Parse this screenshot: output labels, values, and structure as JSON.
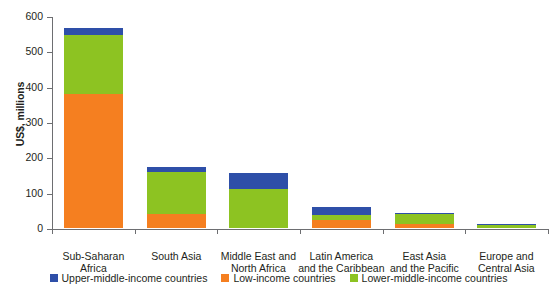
{
  "chart_data": {
    "type": "bar",
    "subtype": "stacked-vertical",
    "title": "",
    "xlabel": "",
    "ylabel": "US$, millions",
    "ylim": [
      0,
      600
    ],
    "yticks": [
      0,
      100,
      200,
      300,
      400,
      500,
      600
    ],
    "ytick_labels": [
      "0",
      "100",
      "200",
      "300",
      "400",
      "500",
      "600"
    ],
    "grid": false,
    "legend_position": "bottom-center",
    "categories": [
      "Sub-Saharan Africa",
      "South Asia",
      "Middle East and North Africa",
      "Latin America and the Caribbean",
      "East Asia and the Pacific",
      "Europe and Central Asia"
    ],
    "category_lines": [
      [
        "Sub-Saharan",
        "Africa"
      ],
      [
        "South Asia"
      ],
      [
        "Middle East and",
        "North Africa"
      ],
      [
        "Latin America",
        "and the Caribbean"
      ],
      [
        "East Asia",
        "and the Pacific"
      ],
      [
        "Europe and",
        "Central Asia"
      ]
    ],
    "series": [
      {
        "name": "Low-income countries",
        "color": "#f57f20",
        "values": [
          379,
          40,
          0,
          23,
          11,
          0
        ]
      },
      {
        "name": "Lower-middle-income countries",
        "color": "#8dc322",
        "values": [
          166,
          118,
          110,
          14,
          28,
          8
        ]
      },
      {
        "name": "Upper-middle-income countries",
        "color": "#2e4fa8",
        "values": [
          20,
          15,
          45,
          22,
          3,
          4
        ]
      }
    ],
    "totals": [
      565,
      173,
      155,
      59,
      42,
      12
    ],
    "stack_order_bottom_to_top": [
      "Low-income countries",
      "Lower-middle-income countries",
      "Upper-middle-income countries"
    ]
  },
  "legend": {
    "items": [
      {
        "label": "Upper-middle-income countries",
        "color": "#2e4fa8"
      },
      {
        "label": "Low-income countries",
        "color": "#f57f20"
      },
      {
        "label": "Lower-middle-income countries",
        "color": "#8dc322"
      }
    ]
  },
  "colors": {
    "upper_middle_income": "#2e4fa8",
    "low_income": "#f57f20",
    "lower_middle_income": "#8dc322",
    "axis": "#6d6e71",
    "text": "#231f20",
    "background": "#ffffff"
  }
}
